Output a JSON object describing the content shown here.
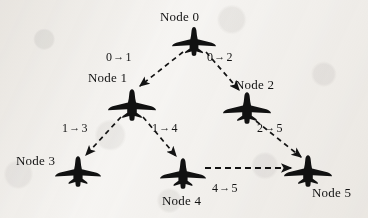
{
  "figure": {
    "kind": "network-topology-diagram",
    "node_icon": "fighter-jet-icon",
    "edge_style": "dashed-arrow",
    "background_color": "#f7f6f4",
    "ink_color": "#131313"
  },
  "nodes": [
    {
      "id": 0,
      "label": "Node 0",
      "icon": "fighter-jet-icon",
      "x": 194,
      "y": 46,
      "label_x": 160,
      "label_y": 10
    },
    {
      "id": 1,
      "label": "Node 1",
      "icon": "fighter-jet-icon",
      "x": 132,
      "y": 106,
      "label_x": 88,
      "label_y": 71
    },
    {
      "id": 2,
      "label": "Node 2",
      "icon": "fighter-jet-icon",
      "x": 247,
      "y": 110,
      "label_x": 235,
      "label_y": 78
    },
    {
      "id": 3,
      "label": "Node 3",
      "icon": "fighter-jet-icon",
      "x": 78,
      "y": 173,
      "label_x": 16,
      "label_y": 154
    },
    {
      "id": 4,
      "label": "Node 4",
      "icon": "fighter-jet-icon",
      "x": 183,
      "y": 176,
      "label_x": 162,
      "label_y": 194
    },
    {
      "id": 5,
      "label": "Node 5",
      "icon": "fighter-jet-icon",
      "x": 308,
      "y": 173,
      "label_x": 312,
      "label_y": 186
    }
  ],
  "edges": [
    {
      "from": 0,
      "to": 1,
      "label": "0 → 1",
      "from_text": "0",
      "link_glyph": "→",
      "to_text": "1",
      "label_x": 106,
      "label_y": 51
    },
    {
      "from": 0,
      "to": 2,
      "label": "0 → 2",
      "from_text": "0",
      "link_glyph": "→",
      "to_text": "2",
      "label_x": 207,
      "label_y": 51
    },
    {
      "from": 1,
      "to": 3,
      "label": "1 → 3",
      "from_text": "1",
      "link_glyph": "→",
      "to_text": "3",
      "label_x": 62,
      "label_y": 122
    },
    {
      "from": 1,
      "to": 4,
      "label": "1 → 4",
      "from_text": "1",
      "link_glyph": "→",
      "to_text": "4",
      "label_x": 152,
      "label_y": 122
    },
    {
      "from": 2,
      "to": 5,
      "label": "2 → 5",
      "from_text": "2",
      "link_glyph": "→",
      "to_text": "5",
      "label_x": 257,
      "label_y": 122
    },
    {
      "from": 4,
      "to": 5,
      "label": "4 → 5",
      "from_text": "4",
      "link_glyph": "→",
      "to_text": "5",
      "label_x": 212,
      "label_y": 182
    }
  ]
}
